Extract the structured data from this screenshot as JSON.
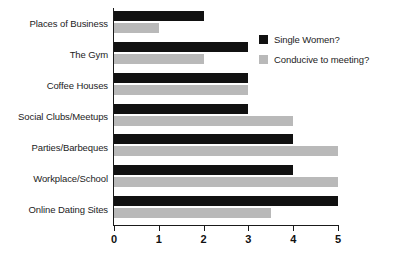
{
  "chart_data": {
    "type": "bar",
    "orientation": "horizontal",
    "title": "",
    "subtitle": "",
    "xlabel": "",
    "ylabel": "",
    "xlim": [
      0,
      5
    ],
    "xticks": [
      "0",
      "1",
      "2",
      "3",
      "4",
      "5"
    ],
    "grid": false,
    "legend_position": "upper-right-inside",
    "categories": [
      "Places of Business",
      "The Gym",
      "Coffee Houses",
      "Social Clubs/Meetups",
      "Parties/Barbeques",
      "Workplace/School",
      "Online Dating Sites"
    ],
    "series": [
      {
        "name": "Single Women?",
        "color": "#111111",
        "values": [
          2,
          3,
          3,
          3,
          4,
          4,
          5
        ]
      },
      {
        "name": "Conducive to meeting?",
        "color": "#b9b9b9",
        "values": [
          1,
          2,
          3,
          4,
          5,
          5,
          3.5
        ]
      }
    ]
  },
  "legend": {
    "items": [
      {
        "label": "Single Women?",
        "swatch": "#111111"
      },
      {
        "label": "Conducive to meeting?",
        "swatch": "#b9b9b9"
      }
    ]
  },
  "axis": {
    "line_color": "#1a1a1a"
  }
}
